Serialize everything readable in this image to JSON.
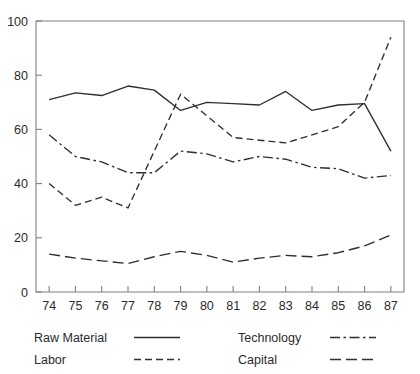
{
  "chart_data": {
    "type": "line",
    "title": "",
    "xlabel": "",
    "ylabel": "",
    "xlim": [
      73.5,
      87.5
    ],
    "ylim": [
      0,
      100
    ],
    "grid": false,
    "legend_position": "below-plot",
    "x": [
      74,
      75,
      76,
      77,
      78,
      79,
      80,
      81,
      82,
      83,
      84,
      85,
      86,
      87
    ],
    "xtick_labels": [
      "74",
      "75",
      "76",
      "77",
      "78",
      "79",
      "80",
      "81",
      "82",
      "83",
      "84",
      "85",
      "86",
      "87"
    ],
    "ytick_labels": [
      "0",
      "20",
      "40",
      "60",
      "80",
      "100"
    ],
    "ytick_values": [
      0,
      20,
      40,
      60,
      80,
      100
    ],
    "series": [
      {
        "name": "Raw Material",
        "style": "solid",
        "values": [
          71,
          73.5,
          72.5,
          76,
          74.5,
          67,
          70,
          69.5,
          69,
          74,
          67,
          69,
          69.5,
          52
        ]
      },
      {
        "name": "Labor",
        "style": "dashed",
        "values": [
          40,
          32,
          35,
          31,
          52,
          73,
          65,
          57,
          56,
          55,
          58,
          61,
          70,
          94
        ]
      },
      {
        "name": "Technology",
        "style": "dash-dot",
        "values": [
          58,
          50,
          48,
          44,
          44,
          52,
          51,
          48,
          50,
          49,
          46,
          45.5,
          42,
          43
        ]
      },
      {
        "name": "Capital",
        "style": "long-dash",
        "values": [
          14,
          12.5,
          11.5,
          10.5,
          13,
          15,
          13.5,
          11,
          12.5,
          13.5,
          13,
          14.5,
          17,
          21
        ]
      }
    ]
  },
  "legend": {
    "entries": [
      {
        "label": "Raw Material",
        "style": "solid"
      },
      {
        "label": "Technology",
        "style": "dash-dot"
      },
      {
        "label": "Labor",
        "style": "dashed"
      },
      {
        "label": "Capital",
        "style": "long-dash"
      }
    ]
  }
}
